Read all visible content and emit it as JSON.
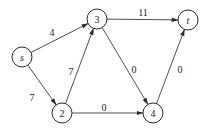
{
  "diagram": {
    "type": "directed-flow-network",
    "nodes": [
      {
        "id": "s",
        "label": "s",
        "italic": true,
        "x": 22,
        "y": 57
      },
      {
        "id": "3",
        "label": "3",
        "italic": false,
        "x": 97,
        "y": 19
      },
      {
        "id": "t",
        "label": "t",
        "italic": true,
        "x": 188,
        "y": 20
      },
      {
        "id": "2",
        "label": "2",
        "italic": false,
        "x": 62,
        "y": 113
      },
      {
        "id": "4",
        "label": "4",
        "italic": false,
        "x": 153,
        "y": 113
      }
    ],
    "edges": [
      {
        "from": "s",
        "to": "3",
        "weight": "4",
        "label_x": 52,
        "label_y": 32
      },
      {
        "from": "s",
        "to": "2",
        "weight": "7",
        "label_x": 32,
        "label_y": 97
      },
      {
        "from": "2",
        "to": "3",
        "weight": "7",
        "label_x": 71,
        "label_y": 71
      },
      {
        "from": "3",
        "to": "t",
        "weight": "11",
        "label_x": 143,
        "label_y": 12
      },
      {
        "from": "3",
        "to": "4",
        "weight": "0",
        "label_x": 134,
        "label_y": 69
      },
      {
        "from": "2",
        "to": "4",
        "weight": "0",
        "label_x": 104,
        "label_y": 107
      },
      {
        "from": "4",
        "to": "t",
        "weight": "0",
        "label_x": 180,
        "label_y": 69
      }
    ],
    "node_radius": 10,
    "colors": {
      "stroke": "#2a2a2a",
      "background": "#ffffff",
      "text": "#222222"
    }
  }
}
